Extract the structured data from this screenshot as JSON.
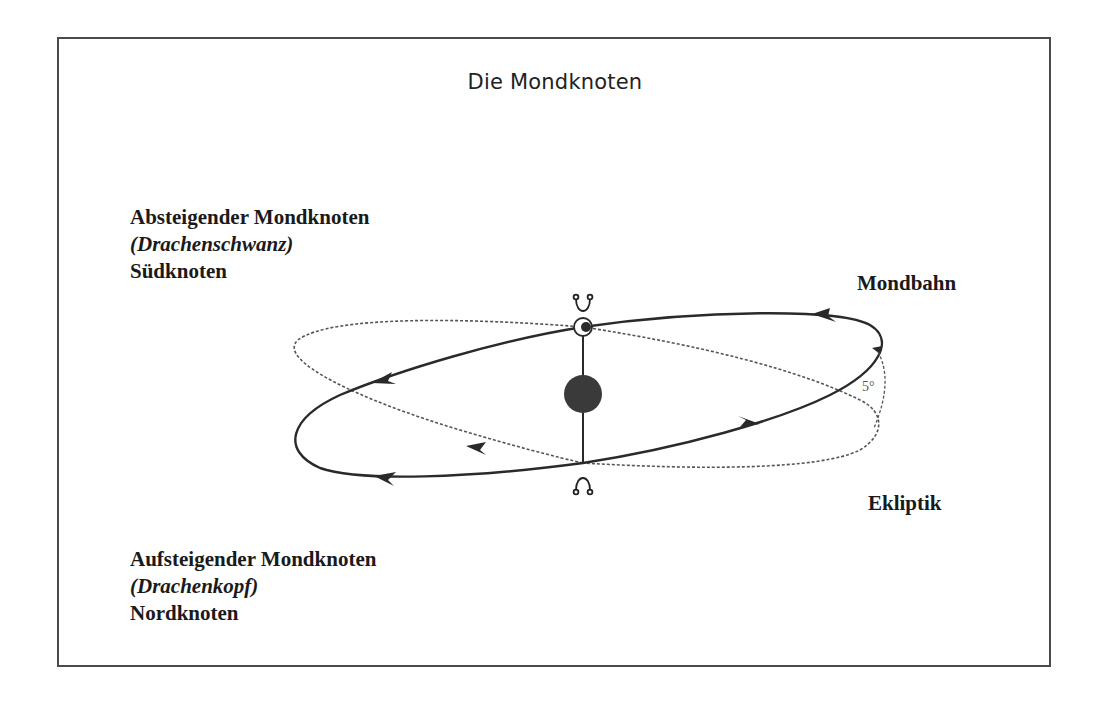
{
  "title": "Die Mondknoten",
  "labels": {
    "descending": {
      "name": "Absteigender Mondknoten",
      "alias": "(Drachenschwanz)",
      "short": "Südknoten"
    },
    "ascending": {
      "name": "Aufsteigender Mondknoten",
      "alias": "(Drachenkopf)",
      "short": "Nordknoten"
    },
    "moon_orbit": "Mondbahn",
    "ecliptic": "Ekliptik",
    "inclination": "5°"
  },
  "symbols": {
    "descending_node": "☋",
    "ascending_node": "☊"
  },
  "colors": {
    "line": "#2a2a2a",
    "dotted": "#555555",
    "earth": "#3a3a3a"
  }
}
